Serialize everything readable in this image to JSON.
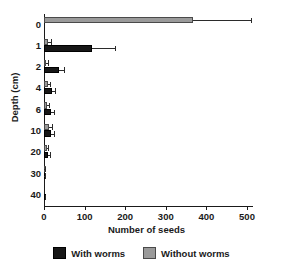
{
  "chart_data": {
    "type": "bar",
    "orientation": "horizontal",
    "title": "",
    "xlabel": "Number of seeds",
    "ylabel": "Depth (cm)",
    "xlim": [
      0,
      550
    ],
    "ylim_note": "categorical depth classes, ordered top to bottom",
    "grid": false,
    "legend_position": "bottom",
    "xticks": [
      0,
      100,
      200,
      300,
      400,
      500
    ],
    "xtick_labels": [
      "0",
      "100",
      "200",
      "300",
      "400",
      "500"
    ],
    "categories": [
      "0",
      "1",
      "2",
      "4",
      "6",
      "10",
      "20",
      "30",
      "40"
    ],
    "ytick_labels": [
      "0",
      "1",
      "2",
      "4",
      "6",
      "10",
      "20",
      "30",
      "40"
    ],
    "series": [
      {
        "name": "With worms",
        "color": "#171717",
        "values": [
          0,
          118,
          36,
          20,
          17,
          17,
          10,
          1,
          2
        ],
        "errors_upper": [
          0,
          174,
          49,
          27,
          24,
          25,
          14,
          2,
          3
        ]
      },
      {
        "name": "Without worms",
        "color": "#9a9a9a",
        "values": [
          367,
          11,
          6,
          11,
          8,
          12,
          7,
          1,
          0
        ],
        "errors_upper": [
          510,
          17,
          10,
          16,
          13,
          19,
          11,
          2,
          0
        ]
      }
    ],
    "legend_entries": [
      {
        "label": "With worms",
        "color": "#171717"
      },
      {
        "label": "Without worms",
        "color": "#9a9a9a"
      }
    ]
  },
  "axes": {
    "x_title": "Number of seeds",
    "y_title": "Depth (cm)"
  },
  "legend": {
    "items": [
      {
        "label": "With worms"
      },
      {
        "label": "Without worms"
      }
    ]
  }
}
